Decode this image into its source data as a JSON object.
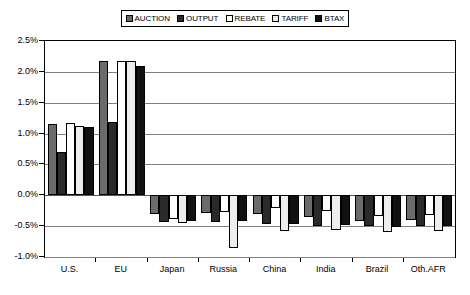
{
  "chart_data": {
    "type": "bar",
    "title": "",
    "subtitle": "",
    "xlabel": "",
    "ylabel": "",
    "grid": true,
    "legend_position": "top",
    "ylim": [
      -1.0,
      2.5
    ],
    "ytick_step": 0.5,
    "ytick_labels": [
      "2.5%",
      "2.0%",
      "1.5%",
      "1.0%",
      "0.5%",
      "0.0%",
      "-0.5%",
      "-1.0%"
    ],
    "ytick_values": [
      2.5,
      2.0,
      1.5,
      1.0,
      0.5,
      0.0,
      -0.5,
      -1.0
    ],
    "unit": "%",
    "categories": [
      "U.S.",
      "EU",
      "Japan",
      "Russia",
      "China",
      "India",
      "Brazil",
      "Oth.AFR"
    ],
    "series": [
      {
        "name": "AUCTION",
        "swatch": "#6b6b6b",
        "values": [
          1.15,
          2.18,
          -0.3,
          -0.28,
          -0.3,
          -0.35,
          -0.42,
          -0.4
        ]
      },
      {
        "name": "OUTPUT",
        "swatch": "#2a2a2a",
        "values": [
          0.7,
          1.18,
          -0.43,
          -0.43,
          -0.47,
          -0.5,
          -0.5,
          -0.5
        ]
      },
      {
        "name": "REBATE",
        "swatch": "#ffffff",
        "values": [
          1.17,
          2.17,
          -0.38,
          -0.27,
          -0.2,
          -0.25,
          -0.33,
          -0.32
        ]
      },
      {
        "name": "TARIFF",
        "swatch": "#ededed",
        "values": [
          1.13,
          2.18,
          -0.45,
          -0.85,
          -0.58,
          -0.57,
          -0.6,
          -0.58
        ]
      },
      {
        "name": "BTAX",
        "swatch": "#111111",
        "values": [
          1.1,
          2.1,
          -0.42,
          -0.42,
          -0.47,
          -0.48,
          -0.52,
          -0.5
        ]
      }
    ]
  },
  "legend": {
    "items": [
      {
        "label": "AUCTION"
      },
      {
        "label": "OUTPUT"
      },
      {
        "label": "REBATE"
      },
      {
        "label": "TARIFF"
      },
      {
        "label": "BTAX"
      }
    ]
  }
}
